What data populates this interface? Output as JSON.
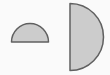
{
  "figure": {
    "canvas": {
      "width": 110,
      "height": 75,
      "background_color": "#fafafa"
    },
    "style": {
      "fill_color": "#cccccc",
      "outline_color": "#606060",
      "outline_width": 1.5
    },
    "shapes": [
      {
        "id": "small-semicircle",
        "name": "small-semicircle",
        "label": "Small semicircle",
        "kind": "semicircle",
        "flat_edge": "bottom",
        "orientation": "bulge-up",
        "center_x": 30,
        "center_y": 42,
        "radius": 18.5,
        "fill_color": "#cccccc",
        "outline_color": "#606060",
        "path": "M 11.5 42 A 18.5 18.5 0 0 1 48.5 42 Z"
      },
      {
        "id": "large-semicircle",
        "name": "large-semicircle",
        "label": "Large semicircle",
        "kind": "semicircle",
        "flat_edge": "left",
        "orientation": "bulge-right",
        "center_x": 70,
        "center_y": 37,
        "radius": 33.5,
        "fill_color": "#cccccc",
        "outline_color": "#606060",
        "path": "M 70 3.5 A 33.5 33.5 0 0 1 70 70.5 Z"
      }
    ]
  }
}
